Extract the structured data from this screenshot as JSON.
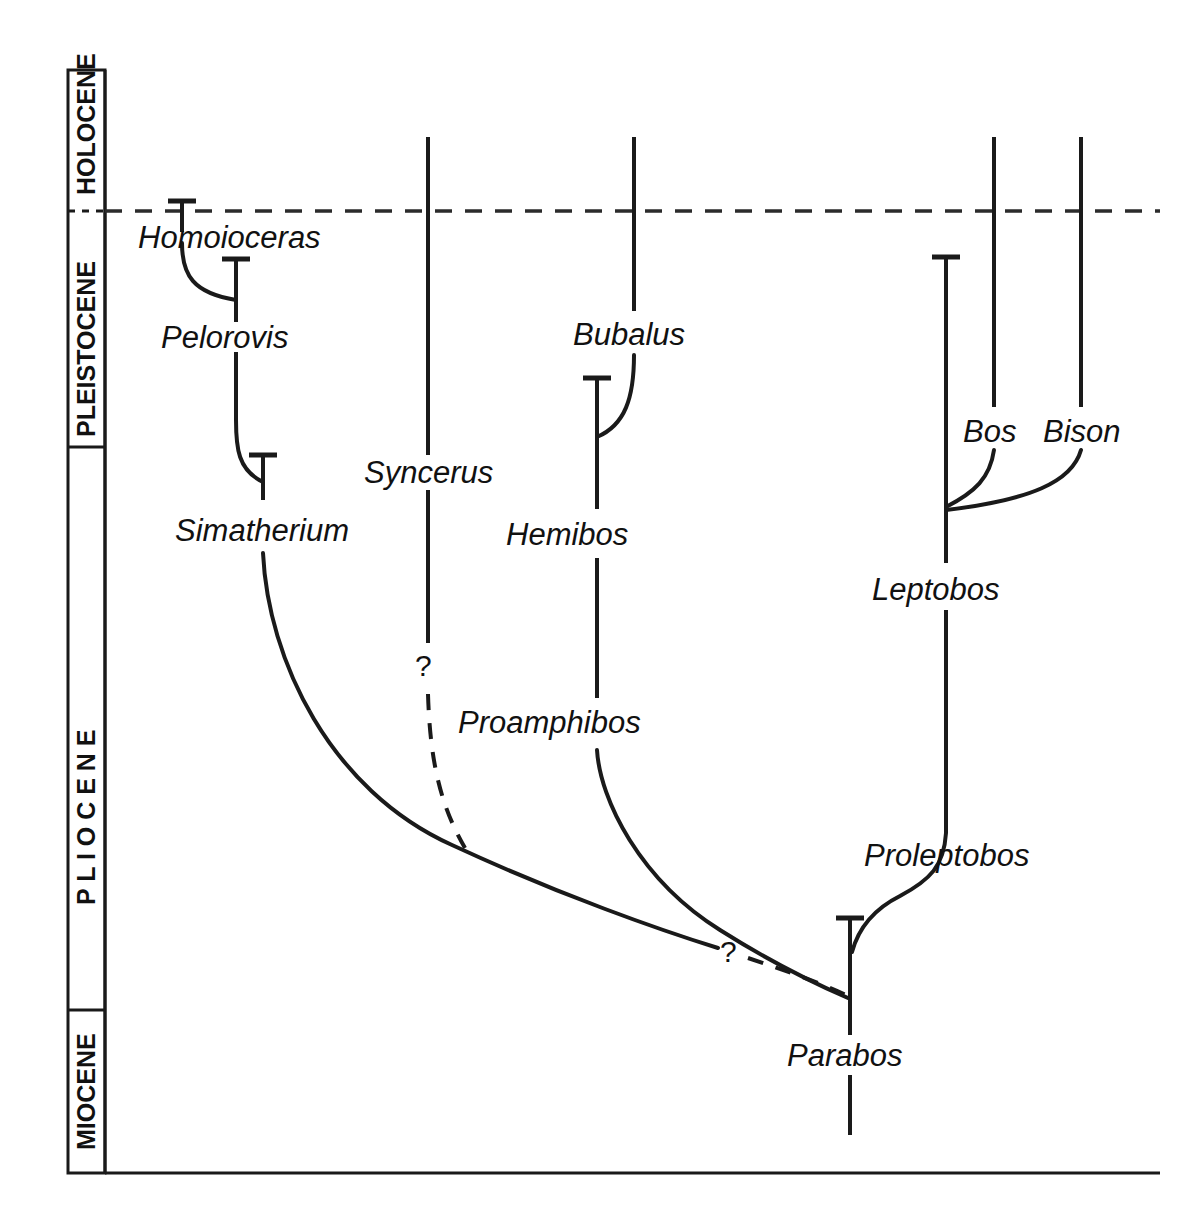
{
  "figure": {
    "domain": "Diagram",
    "kind": "phylogeny-time-chart",
    "background_color": "#ffffff",
    "ink_color": "#1a1a1a"
  },
  "time_axis": {
    "name": "geologic-epoch-axis",
    "orientation": "vertical",
    "order": "youngest-at-top",
    "epochs": [
      {
        "id": "holocene",
        "label": "HOLOCENE",
        "letter_spacing": "normal"
      },
      {
        "id": "pleistocene",
        "label": "PLEISTOCENE",
        "letter_spacing": "normal"
      },
      {
        "id": "pliocene",
        "label": "P L I O C E N E",
        "letter_spacing": "wide"
      },
      {
        "id": "miocene",
        "label": "MIOCENE",
        "letter_spacing": "normal"
      }
    ],
    "boundaries": [
      {
        "id": "holocene-pleistocene",
        "style": "dashed",
        "extends": "full-width"
      },
      {
        "id": "pleistocene-pliocene",
        "style": "solid",
        "extends": "axis-strip-only"
      },
      {
        "id": "pliocene-miocene",
        "style": "solid",
        "extends": "axis-strip-only"
      }
    ]
  },
  "taxa": [
    {
      "id": "homoioceras",
      "label": "Homoioceras"
    },
    {
      "id": "pelorovis",
      "label": "Pelorovis"
    },
    {
      "id": "simatherium",
      "label": "Simatherium"
    },
    {
      "id": "syncerus",
      "label": "Syncerus"
    },
    {
      "id": "bubalus",
      "label": "Bubalus"
    },
    {
      "id": "hemibos",
      "label": "Hemibos"
    },
    {
      "id": "proamphibos",
      "label": "Proamphibos"
    },
    {
      "id": "bos",
      "label": "Bos"
    },
    {
      "id": "bison",
      "label": "Bison"
    },
    {
      "id": "leptobos",
      "label": "Leptobos"
    },
    {
      "id": "proleptobos",
      "label": "Proleptobos"
    },
    {
      "id": "parabos",
      "label": "Parabos"
    }
  ],
  "uncertainty_markers": [
    {
      "id": "syncerus-origin-query",
      "label": "?"
    },
    {
      "id": "simatherium-parabos-query",
      "label": "?"
    }
  ],
  "relationships": [
    {
      "from": "pelorovis",
      "to": "homoioceras",
      "style": "solid"
    },
    {
      "from": "simatherium",
      "to": "pelorovis",
      "style": "solid"
    },
    {
      "from": "parabos",
      "to": "simatherium",
      "style": "dashed",
      "uncertain": true
    },
    {
      "from": "unknown",
      "to": "syncerus",
      "style": "dashed",
      "uncertain": true
    },
    {
      "from": "hemibos",
      "to": "bubalus",
      "style": "solid"
    },
    {
      "from": "proamphibos",
      "to": "hemibos",
      "style": "solid"
    },
    {
      "from": "parabos",
      "to": "proamphibos",
      "style": "solid"
    },
    {
      "from": "leptobos",
      "to": "bos",
      "style": "solid"
    },
    {
      "from": "leptobos",
      "to": "bison",
      "style": "solid"
    },
    {
      "from": "proleptobos",
      "to": "leptobos",
      "style": "solid"
    },
    {
      "from": "parabos",
      "to": "proleptobos",
      "style": "solid"
    }
  ],
  "extant_taxa": [
    "syncerus",
    "bubalus",
    "bos",
    "bison"
  ],
  "caption": {
    "text": ""
  }
}
